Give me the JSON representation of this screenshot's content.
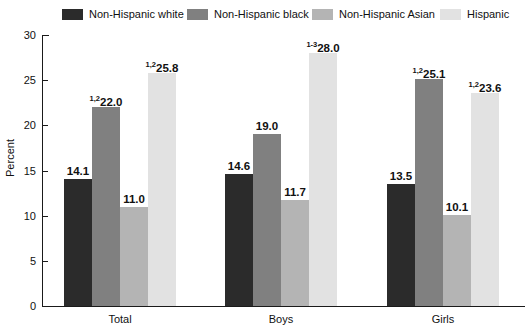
{
  "chart_data": {
    "type": "bar",
    "title": "",
    "xlabel": "",
    "ylabel": "Percent",
    "ylim": [
      0,
      30
    ],
    "yticks": [
      0,
      5,
      10,
      15,
      20,
      25,
      30
    ],
    "ytick_labels": [
      "0",
      "5",
      "10",
      "15",
      "20",
      "25",
      "30"
    ],
    "grid": false,
    "legend_position": "top",
    "categories": [
      "Total",
      "Boys",
      "Girls"
    ],
    "series": [
      {
        "name": "Non-Hispanic white",
        "color": "#2b2b2b",
        "values": [
          14.1,
          14.6,
          13.5
        ],
        "labels": [
          "14.1",
          "14.6",
          "13.5"
        ],
        "superscripts": [
          "",
          "",
          ""
        ]
      },
      {
        "name": "Non-Hispanic black",
        "color": "#808080",
        "values": [
          22.0,
          19.0,
          25.1
        ],
        "labels": [
          "22.0",
          "19.0",
          "25.1"
        ],
        "superscripts": [
          "1,2",
          "",
          "1,2"
        ]
      },
      {
        "name": "Non-Hispanic Asian",
        "color": "#b4b4b4",
        "values": [
          11.0,
          11.7,
          10.1
        ],
        "labels": [
          "11.0",
          "11.7",
          "10.1"
        ],
        "superscripts": [
          "",
          "",
          ""
        ]
      },
      {
        "name": "Hispanic",
        "color": "#e2e2e2",
        "values": [
          25.8,
          28.0,
          23.6
        ],
        "labels": [
          "25.8",
          "28.0",
          "23.6"
        ],
        "superscripts": [
          "1,2",
          "1-3",
          "1,2"
        ]
      }
    ]
  },
  "legend": {
    "items": [
      {
        "label": "Non-Hispanic white",
        "color": "#2b2b2b",
        "left": 62
      },
      {
        "label": "Non-Hispanic black",
        "color": "#808080",
        "left": 187
      },
      {
        "label": "Non-Hispanic Asian",
        "color": "#b4b4b4",
        "left": 312
      },
      {
        "label": "Hispanic",
        "color": "#e2e2e2",
        "left": 440
      }
    ]
  },
  "axis": {
    "y_label": "Percent",
    "y_ticks": [
      "30",
      "25",
      "20",
      "15",
      "10",
      "5",
      "0"
    ]
  },
  "x_labels": [
    "Total",
    "Boys",
    "Girls"
  ]
}
